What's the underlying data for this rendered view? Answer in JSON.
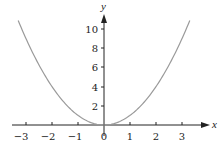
{
  "chart_data": {
    "type": "line",
    "title": "",
    "xlabel": "x",
    "ylabel": "y",
    "function": "y = x^2",
    "xlim": [
      -3.3,
      3.3
    ],
    "ylim": [
      0,
      11
    ],
    "x_ticks": [
      -3,
      -2,
      -1,
      0,
      1,
      2,
      3
    ],
    "x_tick_labels": [
      "−3",
      "−2",
      "−1",
      "0",
      "1",
      "2",
      "3"
    ],
    "y_ticks": [
      2,
      4,
      6,
      8,
      10
    ],
    "y_tick_labels": [
      "2",
      "4",
      "6",
      "8",
      "10"
    ],
    "grid": false,
    "legend": null,
    "series": [
      {
        "name": "y = x^2",
        "color": "#9a9a9a",
        "x": [
          -3.3,
          -3,
          -2.5,
          -2,
          -1.5,
          -1,
          -0.5,
          0,
          0.5,
          1,
          1.5,
          2,
          2.5,
          3,
          3.3
        ],
        "y": [
          10.89,
          9,
          6.25,
          4,
          2.25,
          1,
          0.25,
          0,
          0.25,
          1,
          2.25,
          4,
          6.25,
          9,
          10.89
        ]
      }
    ]
  },
  "labels": {
    "x_axis": "x",
    "y_axis": "y",
    "x_ticks": [
      "−3",
      "−2",
      "−1",
      "0",
      "1",
      "2",
      "3"
    ],
    "y_ticks": [
      "2",
      "4",
      "6",
      "8",
      "10"
    ]
  }
}
